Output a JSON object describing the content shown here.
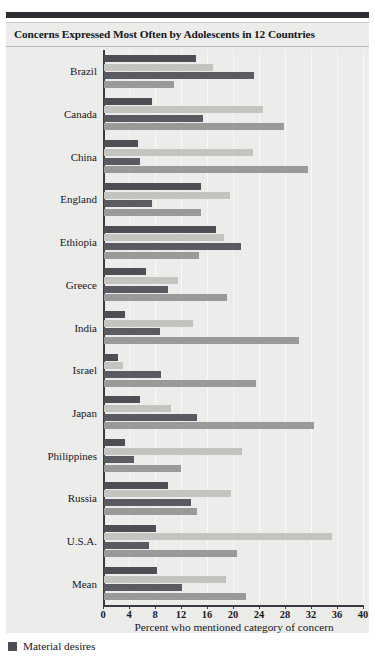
{
  "chart_data": {
    "type": "bar",
    "orientation": "horizontal",
    "title": "Concerns Expressed Most Often by Adolescents in 12 Countries",
    "xlabel": "Percent who mentioned category of concern",
    "ylabel": "",
    "xlim": [
      0,
      40
    ],
    "xticks": [
      0,
      4,
      8,
      12,
      16,
      20,
      24,
      28,
      32,
      36,
      40
    ],
    "grid": true,
    "legend_position": "below-left",
    "categories": [
      "Brazil",
      "Canada",
      "China",
      "England",
      "Ethiopia",
      "Greece",
      "India",
      "Israel",
      "Japan",
      "Philippines",
      "Russia",
      "U.S.A.",
      "Mean"
    ],
    "series": [
      {
        "name": "Material desires",
        "color": "#4e4e55",
        "values": [
          14.2,
          7.4,
          5.2,
          14.9,
          17.2,
          6.5,
          3.2,
          2.2,
          5.5,
          3.2,
          9.8,
          8.0,
          8.2
        ]
      },
      {
        "name": "",
        "color": "#c3c3bf",
        "values": [
          16.8,
          24.5,
          22.9,
          19.4,
          18.5,
          11.4,
          13.7,
          2.9,
          10.3,
          21.2,
          19.5,
          35.1,
          18.8
        ]
      },
      {
        "name": "",
        "color": "#5a5a62",
        "values": [
          23.1,
          15.2,
          5.5,
          7.4,
          21.1,
          9.8,
          8.6,
          8.8,
          14.3,
          4.6,
          13.4,
          6.9,
          12.0
        ]
      },
      {
        "name": "",
        "color": "#9a9a98",
        "values": [
          10.8,
          27.7,
          31.4,
          14.9,
          14.6,
          18.9,
          30.0,
          23.4,
          32.3,
          11.8,
          14.3,
          20.5,
          21.8
        ]
      }
    ],
    "legend": [
      {
        "label": "Material desires",
        "color": "#4e4e55"
      }
    ]
  }
}
